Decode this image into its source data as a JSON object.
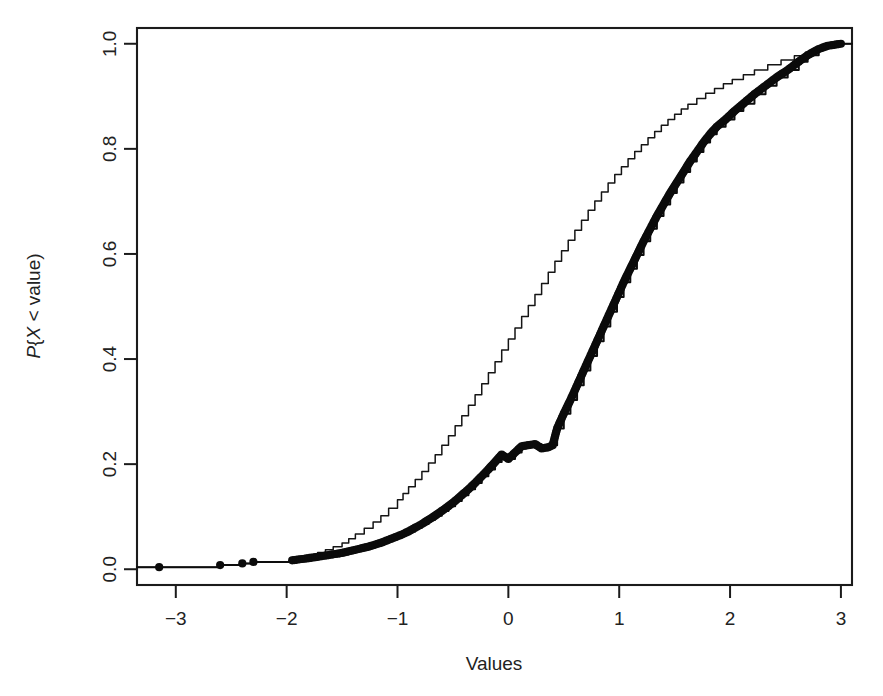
{
  "chart_data": {
    "type": "line",
    "title": "",
    "subtitle": "",
    "xlabel": "Values",
    "ylabel": "P{X < value)",
    "xlim": [
      -3.35,
      3.1
    ],
    "ylim": [
      -0.03,
      1.03
    ],
    "grid": false,
    "legend": "none",
    "xticks": [
      -3,
      -2,
      -1,
      0,
      1,
      2,
      3
    ],
    "xtick_labels": [
      "−3",
      "−2",
      "−1",
      "0",
      "1",
      "2",
      "3"
    ],
    "yticks": [
      0.0,
      0.2,
      0.4,
      0.6,
      0.8,
      1.0
    ],
    "ytick_labels": [
      "0.0",
      "0.2",
      "0.4",
      "0.6",
      "0.8",
      "1.0"
    ],
    "series": [
      {
        "name": "ecdf-thin-line",
        "style": "step-line",
        "marker": "none",
        "color": "#151515",
        "linewidth": 1.5,
        "x": [
          -3.15,
          -2.6,
          -2.4,
          -2.3,
          -1.95,
          -1.9,
          -1.85,
          -1.8,
          -1.72,
          -1.65,
          -1.58,
          -1.5,
          -1.44,
          -1.38,
          -1.3,
          -1.22,
          -1.15,
          -1.08,
          -1.0,
          -0.95,
          -0.9,
          -0.84,
          -0.78,
          -0.72,
          -0.66,
          -0.6,
          -0.54,
          -0.48,
          -0.42,
          -0.36,
          -0.3,
          -0.24,
          -0.18,
          -0.12,
          -0.06,
          0.0,
          0.06,
          0.12,
          0.18,
          0.24,
          0.3,
          0.36,
          0.42,
          0.48,
          0.54,
          0.6,
          0.66,
          0.72,
          0.78,
          0.84,
          0.9,
          0.96,
          1.02,
          1.08,
          1.14,
          1.2,
          1.26,
          1.32,
          1.38,
          1.44,
          1.5,
          1.56,
          1.62,
          1.7,
          1.78,
          1.86,
          1.94,
          2.02,
          2.12,
          2.22,
          2.34,
          2.46,
          2.58,
          2.68,
          2.78,
          2.88,
          3.0
        ],
        "y": [
          0.004,
          0.008,
          0.011,
          0.014,
          0.018,
          0.021,
          0.024,
          0.028,
          0.032,
          0.037,
          0.043,
          0.05,
          0.058,
          0.067,
          0.078,
          0.09,
          0.102,
          0.116,
          0.132,
          0.144,
          0.157,
          0.171,
          0.186,
          0.202,
          0.218,
          0.236,
          0.254,
          0.273,
          0.292,
          0.312,
          0.332,
          0.353,
          0.374,
          0.395,
          0.417,
          0.438,
          0.459,
          0.481,
          0.502,
          0.523,
          0.544,
          0.565,
          0.586,
          0.606,
          0.626,
          0.645,
          0.664,
          0.683,
          0.701,
          0.718,
          0.735,
          0.751,
          0.766,
          0.781,
          0.795,
          0.808,
          0.821,
          0.833,
          0.845,
          0.856,
          0.866,
          0.876,
          0.885,
          0.896,
          0.906,
          0.915,
          0.924,
          0.932,
          0.941,
          0.95,
          0.96,
          0.969,
          0.977,
          0.984,
          0.991,
          0.996,
          1.0
        ]
      },
      {
        "name": "ecdf-thick-points",
        "style": "step-line-with-points",
        "marker": "filled-circle",
        "marker_size": 7,
        "color": "#0d0d0d",
        "linewidth": 2.0,
        "x": [
          -3.15,
          -2.6,
          -2.4,
          -2.3,
          -1.95,
          -1.88,
          -1.8,
          -1.74,
          -1.68,
          -1.62,
          -1.56,
          -1.5,
          -1.44,
          -1.38,
          -1.32,
          -1.26,
          -1.2,
          -1.14,
          -1.08,
          -1.02,
          -0.96,
          -0.9,
          -0.84,
          -0.78,
          -0.72,
          -0.66,
          -0.6,
          -0.54,
          -0.48,
          -0.42,
          -0.36,
          -0.3,
          -0.24,
          -0.18,
          -0.12,
          -0.06,
          0.0,
          0.06,
          0.12,
          0.18,
          0.24,
          0.3,
          0.36,
          0.4,
          0.44,
          0.5,
          0.56,
          0.62,
          0.68,
          0.74,
          0.8,
          0.86,
          0.92,
          0.98,
          1.04,
          1.1,
          1.16,
          1.22,
          1.28,
          1.34,
          1.4,
          1.46,
          1.52,
          1.58,
          1.64,
          1.7,
          1.76,
          1.82,
          1.88,
          1.96,
          2.04,
          2.12,
          2.22,
          2.32,
          2.42,
          2.52,
          2.62,
          2.7,
          2.8,
          2.88,
          3.0
        ],
        "y": [
          0.004,
          0.008,
          0.011,
          0.014,
          0.017,
          0.019,
          0.021,
          0.023,
          0.025,
          0.027,
          0.029,
          0.031,
          0.034,
          0.037,
          0.04,
          0.043,
          0.047,
          0.051,
          0.056,
          0.061,
          0.066,
          0.072,
          0.079,
          0.086,
          0.094,
          0.102,
          0.111,
          0.12,
          0.13,
          0.141,
          0.152,
          0.164,
          0.177,
          0.19,
          0.204,
          0.218,
          0.21,
          0.222,
          0.234,
          0.236,
          0.238,
          0.23,
          0.232,
          0.236,
          0.268,
          0.296,
          0.322,
          0.35,
          0.378,
          0.406,
          0.434,
          0.462,
          0.49,
          0.518,
          0.546,
          0.572,
          0.598,
          0.624,
          0.648,
          0.672,
          0.694,
          0.716,
          0.736,
          0.756,
          0.776,
          0.794,
          0.812,
          0.828,
          0.842,
          0.856,
          0.872,
          0.886,
          0.904,
          0.92,
          0.936,
          0.95,
          0.966,
          0.978,
          0.99,
          0.996,
          1.0
        ]
      }
    ]
  }
}
